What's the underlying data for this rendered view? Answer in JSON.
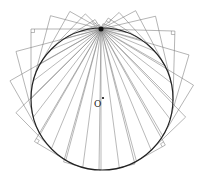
{
  "diagram": {
    "title": "",
    "labels": {
      "center": "O"
    },
    "circle": {
      "cx": 102,
      "cy": 99,
      "r": 71,
      "stroke": "#222222"
    },
    "pole": {
      "x": 101,
      "y": 29
    },
    "center_dot": {
      "x": 103,
      "y": 98
    },
    "ray_count": 24,
    "colors": {
      "chord": "#8a8a8a",
      "frame": "#777777",
      "circle": "#222222",
      "pole": "#111111"
    }
  }
}
